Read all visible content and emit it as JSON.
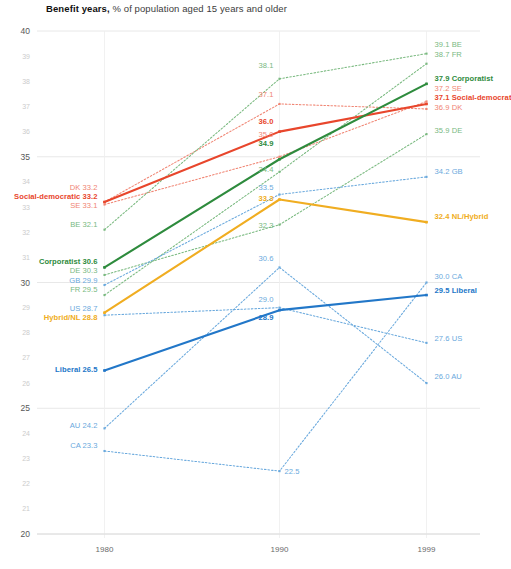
{
  "title": {
    "strong": "Benefit years,",
    "rest": " % of population aged 15 years and older"
  },
  "chart_data": {
    "type": "line",
    "title": "Benefit years, % of population aged 15 years and older",
    "xlabel": "",
    "ylabel": "",
    "x": [
      1980,
      1990,
      1999
    ],
    "xtick_labels": [
      "1980",
      "1990",
      "1999"
    ],
    "ylim": [
      20,
      40
    ],
    "ytick_major": [
      "20",
      "25",
      "30",
      "35",
      "40"
    ],
    "ytick_minor": [
      "21",
      "22",
      "23",
      "24",
      "26",
      "27",
      "28",
      "29",
      "31",
      "32",
      "33",
      "34",
      "36",
      "37",
      "38",
      "39"
    ],
    "grid": "horizontal-major",
    "legend": "inline-endpoint-labels",
    "series": [
      {
        "name": "Social-democratic",
        "kind": "group",
        "color": "#e8462c",
        "style": "solid",
        "values": [
          33.2,
          36.0,
          37.1
        ],
        "left_label": "Social-democratic 33.2",
        "mid_label": "36.0",
        "right_label": "37.1  Social-democratic"
      },
      {
        "name": "Corporatist",
        "kind": "group",
        "color": "#2e8b3d",
        "style": "solid",
        "values": [
          30.6,
          34.9,
          37.9
        ],
        "left_label": "Corporatist 30.6",
        "mid_label": "34.9",
        "right_label": "37.9  Corporatist"
      },
      {
        "name": "Hybrid/NL",
        "kind": "group",
        "color": "#f0ad21",
        "style": "solid",
        "values": [
          28.8,
          33.3,
          32.4
        ],
        "left_label": "Hybrid/NL 28.8",
        "mid_label": "33.3",
        "right_label": "32.4 NL/Hybrid"
      },
      {
        "name": "Liberal",
        "kind": "group",
        "color": "#2277c8",
        "style": "solid",
        "values": [
          26.5,
          28.9,
          29.5
        ],
        "left_label": "Liberal 26.5",
        "mid_label": "28.9",
        "right_label": "29.5 Liberal"
      },
      {
        "name": "DK",
        "kind": "country",
        "color": "#f08573",
        "style": "dotted",
        "values": [
          33.2,
          37.1,
          36.9
        ],
        "left_label": "DK 33.2",
        "mid_label": "37.1",
        "right_label": "36.9 DK"
      },
      {
        "name": "SE",
        "kind": "country",
        "color": "#f08573",
        "style": "dotted",
        "values": [
          33.1,
          35.0,
          37.2
        ],
        "left_label": "SE 33.1",
        "mid_label": "35.0",
        "right_label": "37.2 SE"
      },
      {
        "name": "BE",
        "kind": "country",
        "color": "#79b97f",
        "style": "dotted",
        "values": [
          32.1,
          38.1,
          39.1
        ],
        "left_label": "BE 32.1",
        "mid_label": "38.1",
        "right_label": "39.1 BE"
      },
      {
        "name": "FR",
        "kind": "country",
        "color": "#79b97f",
        "style": "dotted",
        "values": [
          29.5,
          34.4,
          38.7
        ],
        "left_label": "FR 29.5",
        "mid_label": "34.4",
        "right_label": "38.7 FR"
      },
      {
        "name": "DE",
        "kind": "country",
        "color": "#79b97f",
        "style": "dotted",
        "values": [
          30.3,
          32.3,
          35.9
        ],
        "left_label": "DE 30.3",
        "mid_label": "32.3",
        "right_label": "35.9 DE"
      },
      {
        "name": "GB",
        "kind": "country",
        "color": "#6aa9dd",
        "style": "dotted",
        "values": [
          29.9,
          33.5,
          34.2
        ],
        "left_label": "GB 29.9",
        "mid_label": "33.5",
        "right_label": "34.2 GB"
      },
      {
        "name": "US",
        "kind": "country",
        "color": "#6aa9dd",
        "style": "dotted",
        "values": [
          28.7,
          29.0,
          27.6
        ],
        "left_label": "US 28.7",
        "mid_label": "29.0",
        "right_label": "27.6 US"
      },
      {
        "name": "CA",
        "kind": "country",
        "color": "#6aa9dd",
        "style": "dotted",
        "values": [
          23.3,
          22.5,
          30.0
        ],
        "left_label": "CA 23.3",
        "mid_label": "22.5",
        "right_label": "30.0 CA"
      },
      {
        "name": "AU",
        "kind": "country",
        "color": "#6aa9dd",
        "style": "dotted",
        "values": [
          24.2,
          30.6,
          26.0
        ],
        "left_label": "AU 24.2",
        "mid_label": "30.6",
        "right_label": "26.0 AU"
      }
    ]
  }
}
